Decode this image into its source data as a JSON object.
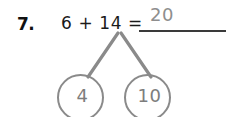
{
  "problem": {
    "number_label": "7.",
    "equation": "6 + 14 =",
    "answer_value": "20",
    "answer_line": "blank-line"
  },
  "number_bond": {
    "parts": [
      {
        "value": "4",
        "position": "left"
      },
      {
        "value": "10",
        "position": "right"
      }
    ],
    "branch_stroke_color": "#8a8a8a",
    "circle_stroke_color": "#8a8a8a",
    "value_text_color": "#7d7d7d"
  },
  "colors": {
    "background": "#ffffff",
    "text_dark": "#111111",
    "equation_text": "#1a1a1a",
    "answer_gray": "#8e8e8e",
    "line_dark": "#3a3a3a"
  }
}
